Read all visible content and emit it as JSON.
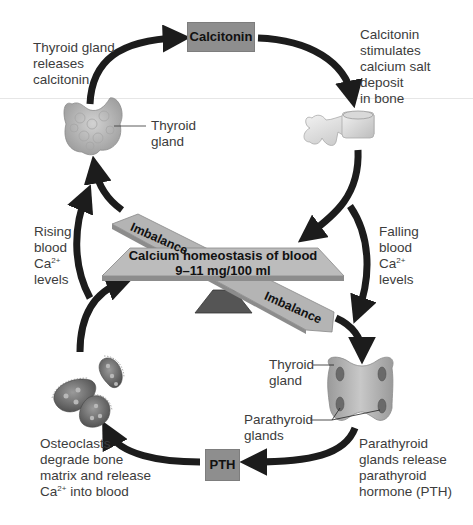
{
  "title": "Calcium homeostasis of blood",
  "center": {
    "line1": "Calcium homeostasis of blood",
    "line2": "9–11 mg/100 ml",
    "imbalance_top": "Imbalance",
    "imbalance_bottom": "Imbalance"
  },
  "hormones": {
    "calcitonin": "Calcitonin",
    "pth": "PTH"
  },
  "labels": {
    "thyroid_releases": [
      "Thyroid gland",
      "releases",
      "calcitonin"
    ],
    "calcitonin_stimulates": [
      "Calcitonin",
      "stimulates",
      "calcium salt",
      "deposit",
      "in bone"
    ],
    "thyroid_gland_top": [
      "Thyroid",
      "gland"
    ],
    "rising": {
      "l1": "Rising",
      "l2": "blood",
      "l3_base": "Ca",
      "l3_sup": "2+",
      "l4": "levels"
    },
    "falling": {
      "l1": "Falling",
      "l2": "blood",
      "l3_base": "Ca",
      "l3_sup": "2+",
      "l4": "levels"
    },
    "thyroid_gland_bottom": [
      "Thyroid",
      "gland"
    ],
    "parathyroid_glands": [
      "Parathyroid",
      "glands"
    ],
    "osteoclasts": {
      "l1": "Osteoclasts",
      "l2": "degrade bone",
      "l3": "matrix and release",
      "l4_base": "Ca",
      "l4_sup": "2+",
      "l4_rest": " into blood"
    },
    "parathyroid_release": [
      "Parathyroid",
      "glands release",
      "parathyroid",
      "hormone (PTH)"
    ]
  },
  "colors": {
    "arrow": "#1c1c1c",
    "box_fill": "#8e8e8e",
    "beam_fill": "#b4b4b4",
    "fulcrum": "#555555",
    "text": "#3c3c3c"
  }
}
